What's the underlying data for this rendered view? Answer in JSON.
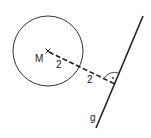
{
  "diagram": {
    "center_label": "M",
    "line_label": "g",
    "segment_labels": [
      "2",
      "2"
    ],
    "colors": {
      "stroke": "#222222",
      "background": "#ffffff"
    }
  }
}
